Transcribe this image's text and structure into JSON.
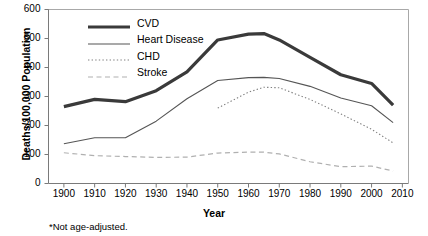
{
  "chart_data": {
    "type": "line",
    "title": "",
    "xlabel": "Year",
    "ylabel": "Deaths/100,000 Population",
    "footnote": "*Not age-adjusted.",
    "xlim": [
      1895,
      2012
    ],
    "ylim": [
      0,
      600
    ],
    "xticks": [
      1900,
      1910,
      1920,
      1930,
      1940,
      1950,
      1960,
      1970,
      1980,
      1990,
      2000,
      2010
    ],
    "yticks": [
      0,
      100,
      200,
      300,
      400,
      500,
      600
    ],
    "grid": false,
    "legend_position": "top-left-inside",
    "series": [
      {
        "name": "CVD",
        "style": "solid-thick",
        "color": "#3a3a3a",
        "width": 3.2,
        "x": [
          1900,
          1910,
          1920,
          1930,
          1940,
          1950,
          1960,
          1965,
          1970,
          1980,
          1990,
          2000,
          2007
        ],
        "values": [
          265,
          290,
          282,
          320,
          385,
          495,
          515,
          517,
          495,
          435,
          375,
          345,
          270
        ]
      },
      {
        "name": "Heart Disease",
        "style": "solid-thin",
        "color": "#555555",
        "width": 1.1,
        "x": [
          1900,
          1910,
          1920,
          1930,
          1940,
          1950,
          1960,
          1965,
          1970,
          1980,
          1990,
          2000,
          2007
        ],
        "values": [
          137,
          158,
          158,
          215,
          292,
          355,
          365,
          366,
          362,
          335,
          295,
          268,
          210
        ]
      },
      {
        "name": "CHD",
        "style": "dotted",
        "color": "#808080",
        "width": 1.1,
        "x": [
          1950,
          1960,
          1965,
          1970,
          1980,
          1990,
          2000,
          2007
        ],
        "values": [
          260,
          315,
          332,
          330,
          290,
          240,
          187,
          140
        ]
      },
      {
        "name": "Stroke",
        "style": "dashed",
        "color": "#b0b0b0",
        "width": 1.2,
        "x": [
          1900,
          1910,
          1920,
          1930,
          1940,
          1950,
          1960,
          1965,
          1970,
          1980,
          1990,
          2000,
          2007
        ],
        "values": [
          106,
          96,
          93,
          90,
          91,
          105,
          108,
          108,
          102,
          75,
          58,
          60,
          43
        ]
      }
    ]
  },
  "legend": {
    "items": [
      {
        "label": "CVD"
      },
      {
        "label": "Heart Disease"
      },
      {
        "label": "CHD"
      },
      {
        "label": "Stroke"
      }
    ]
  },
  "axes": {
    "y_title": "Deaths/100,000 Population",
    "x_title": "Year"
  },
  "notes": {
    "footnote": "*Not age-adjusted."
  }
}
